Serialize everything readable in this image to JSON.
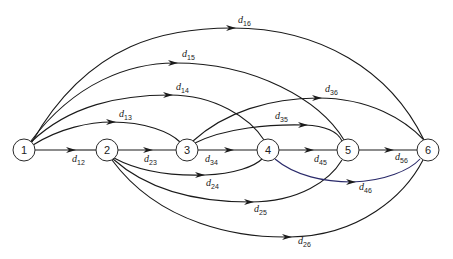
{
  "diagram": {
    "type": "directed-network",
    "nodes": [
      {
        "id": "1",
        "label": "1",
        "x": 24,
        "y": 150
      },
      {
        "id": "2",
        "label": "2",
        "x": 107,
        "y": 150
      },
      {
        "id": "3",
        "label": "3",
        "x": 187,
        "y": 150
      },
      {
        "id": "4",
        "label": "4",
        "x": 268,
        "y": 150
      },
      {
        "id": "5",
        "label": "5",
        "x": 348,
        "y": 150
      },
      {
        "id": "6",
        "label": "6",
        "x": 428,
        "y": 150
      }
    ],
    "edges": [
      {
        "from": "1",
        "to": "2",
        "label": "d",
        "sub": "12"
      },
      {
        "from": "2",
        "to": "3",
        "label": "d",
        "sub": "23"
      },
      {
        "from": "3",
        "to": "4",
        "label": "d",
        "sub": "34"
      },
      {
        "from": "4",
        "to": "5",
        "label": "d",
        "sub": "45"
      },
      {
        "from": "5",
        "to": "6",
        "label": "d",
        "sub": "56"
      },
      {
        "from": "1",
        "to": "3",
        "label": "d",
        "sub": "13"
      },
      {
        "from": "1",
        "to": "4",
        "label": "d",
        "sub": "14"
      },
      {
        "from": "1",
        "to": "5",
        "label": "d",
        "sub": "15"
      },
      {
        "from": "1",
        "to": "6",
        "label": "d",
        "sub": "16"
      },
      {
        "from": "3",
        "to": "5",
        "label": "d",
        "sub": "35"
      },
      {
        "from": "3",
        "to": "6",
        "label": "d",
        "sub": "36"
      },
      {
        "from": "2",
        "to": "4",
        "label": "d",
        "sub": "24"
      },
      {
        "from": "2",
        "to": "5",
        "label": "d",
        "sub": "25"
      },
      {
        "from": "2",
        "to": "6",
        "label": "d",
        "sub": "26"
      },
      {
        "from": "4",
        "to": "6",
        "label": "d",
        "sub": "46"
      }
    ]
  }
}
